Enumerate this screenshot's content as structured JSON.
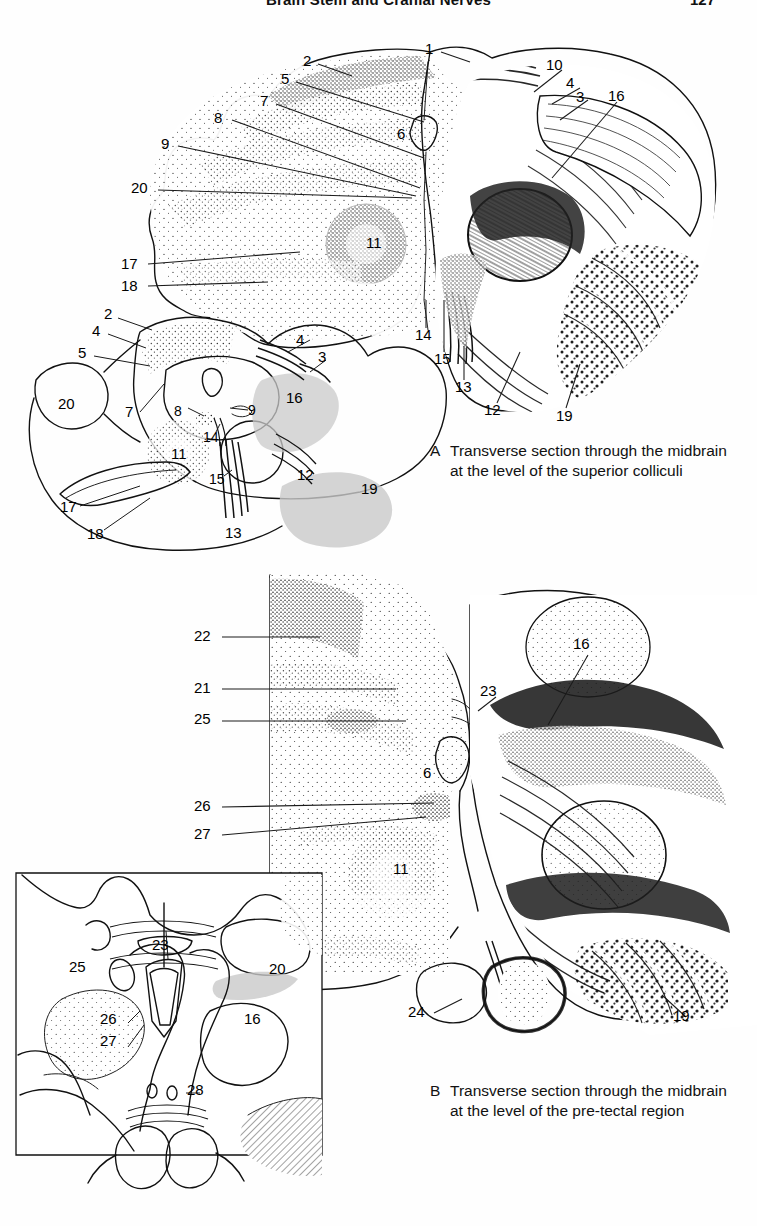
{
  "page": {
    "running_head": "Brain Stem and Cranial Nerves",
    "folio": "127"
  },
  "figures": [
    {
      "id": "A",
      "caption_letter": "A",
      "caption_text": "Transverse section through the midbrain at the level of the superior colliculi",
      "main_labels": [
        "1",
        "2",
        "5",
        "7",
        "8",
        "9",
        "20",
        "6",
        "10",
        "4",
        "3",
        "16",
        "11",
        "17",
        "18",
        "14",
        "15",
        "13",
        "12",
        "19"
      ],
      "schematic_labels": [
        "2",
        "4",
        "5",
        "20",
        "7",
        "8",
        "9",
        "14",
        "11",
        "17",
        "18",
        "15",
        "13",
        "16",
        "12",
        "3"
      ]
    },
    {
      "id": "B",
      "caption_letter": "B",
      "caption_text": "Transverse section through the midbrain at the level of the pre-tectal region",
      "main_labels": [
        "22",
        "21",
        "25",
        "23",
        "16",
        "6",
        "26",
        "27",
        "11",
        "24",
        "19"
      ],
      "schematic_labels": [
        "23",
        "25",
        "20",
        "16",
        "26",
        "27",
        "28"
      ]
    }
  ],
  "fig_a": {
    "main": {
      "l1": {
        "t": "1",
        "x": 425,
        "y": 48
      },
      "l2": {
        "t": "2",
        "x": 303,
        "y": 60
      },
      "l5": {
        "t": "5",
        "x": 281,
        "y": 78
      },
      "l7": {
        "t": "7",
        "x": 260,
        "y": 100
      },
      "l8": {
        "t": "8",
        "x": 216,
        "y": 117
      },
      "l9": {
        "t": "9",
        "x": 163,
        "y": 143
      },
      "l20": {
        "t": "20",
        "x": 133,
        "y": 186
      },
      "l6": {
        "t": "6",
        "x": 399,
        "y": 133
      },
      "l10": {
        "t": "10",
        "x": 549,
        "y": 64
      },
      "l4": {
        "t": "4",
        "x": 568,
        "y": 82
      },
      "l3": {
        "t": "3",
        "x": 578,
        "y": 95
      },
      "l16": {
        "t": "16",
        "x": 611,
        "y": 94
      },
      "l11": {
        "t": "11",
        "x": 370,
        "y": 241
      },
      "l17": {
        "t": "17",
        "x": 123,
        "y": 262
      },
      "l18": {
        "t": "18",
        "x": 123,
        "y": 284
      },
      "l14": {
        "t": "14",
        "x": 418,
        "y": 333
      },
      "l15": {
        "t": "15",
        "x": 437,
        "y": 357
      },
      "l13": {
        "t": "13",
        "x": 458,
        "y": 385
      },
      "l12": {
        "t": "12",
        "x": 487,
        "y": 408
      },
      "l19": {
        "t": "19",
        "x": 559,
        "y": 414
      }
    },
    "schema": {
      "s2": {
        "t": "2",
        "x": 107,
        "y": 313
      },
      "s4": {
        "t": "4",
        "x": 94,
        "y": 330
      },
      "s5": {
        "t": "5",
        "x": 80,
        "y": 352
      },
      "s20": {
        "t": "20",
        "x": 61,
        "y": 403
      },
      "s7": {
        "t": "7",
        "x": 127,
        "y": 411
      },
      "s8": {
        "t": "8",
        "x": 176,
        "y": 410
      },
      "s9": {
        "t": "9",
        "x": 250,
        "y": 409
      },
      "s14": {
        "t": "14",
        "x": 206,
        "y": 436
      },
      "s11": {
        "t": "11",
        "x": 174,
        "y": 452
      },
      "s17": {
        "t": "17",
        "x": 63,
        "y": 505
      },
      "s18": {
        "t": "18",
        "x": 90,
        "y": 532
      },
      "s15": {
        "t": "15",
        "x": 212,
        "y": 478
      },
      "s13": {
        "t": "13",
        "x": 228,
        "y": 531
      },
      "s16": {
        "t": "16",
        "x": 289,
        "y": 396
      },
      "s12": {
        "t": "12",
        "x": 300,
        "y": 473
      },
      "s4b": {
        "t": "4",
        "x": 298,
        "y": 339
      },
      "s3": {
        "t": "3",
        "x": 320,
        "y": 355
      },
      "s19": {
        "t": "19",
        "x": 364,
        "y": 487
      }
    },
    "caption": {
      "x": 430,
      "y": 448
    }
  },
  "fig_b": {
    "main": {
      "l22": {
        "t": "22",
        "x": 196,
        "y": 635
      },
      "l21": {
        "t": "21",
        "x": 196,
        "y": 687
      },
      "l25": {
        "t": "25",
        "x": 196,
        "y": 718
      },
      "l23": {
        "t": "23",
        "x": 483,
        "y": 690
      },
      "l16": {
        "t": "16",
        "x": 576,
        "y": 643
      },
      "l6": {
        "t": "6",
        "x": 425,
        "y": 772
      },
      "l26": {
        "t": "26",
        "x": 196,
        "y": 805
      },
      "l27": {
        "t": "27",
        "x": 196,
        "y": 833
      },
      "l11": {
        "t": "11",
        "x": 396,
        "y": 868
      },
      "l24": {
        "t": "24",
        "x": 411,
        "y": 1010
      },
      "l19": {
        "t": "19",
        "x": 676,
        "y": 1014
      }
    },
    "schema": {
      "s23": {
        "t": "23",
        "x": 155,
        "y": 944
      },
      "s25": {
        "t": "25",
        "x": 72,
        "y": 966
      },
      "s20": {
        "t": "20",
        "x": 272,
        "y": 968
      },
      "s16": {
        "t": "16",
        "x": 247,
        "y": 1018
      },
      "s26": {
        "t": "26",
        "x": 103,
        "y": 1018
      },
      "s27": {
        "t": "27",
        "x": 103,
        "y": 1040
      },
      "s28": {
        "t": "28",
        "x": 190,
        "y": 1089
      }
    },
    "caption": {
      "x": 430,
      "y": 1088
    }
  }
}
